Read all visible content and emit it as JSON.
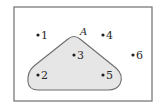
{
  "diagram": {
    "type": "venn",
    "universal_set": {
      "elements": [
        "1",
        "2",
        "3",
        "4",
        "5",
        "6"
      ]
    },
    "sets": [
      {
        "name": "A",
        "label": "A",
        "elements": [
          "2",
          "3",
          "5"
        ],
        "fill": "#e6e6e6",
        "stroke": "#6e6e6e"
      }
    ],
    "points": [
      {
        "id": "1",
        "label": "1",
        "in_A": false
      },
      {
        "id": "2",
        "label": "2",
        "in_A": true
      },
      {
        "id": "3",
        "label": "3",
        "in_A": true
      },
      {
        "id": "4",
        "label": "4",
        "in_A": false
      },
      {
        "id": "5",
        "label": "5",
        "in_A": true
      },
      {
        "id": "6",
        "label": "6",
        "in_A": false
      }
    ],
    "colors": {
      "background": "#ffffff",
      "frame": "#7a7a7a",
      "dot": "#222222",
      "text": "#2a2a2a"
    }
  }
}
